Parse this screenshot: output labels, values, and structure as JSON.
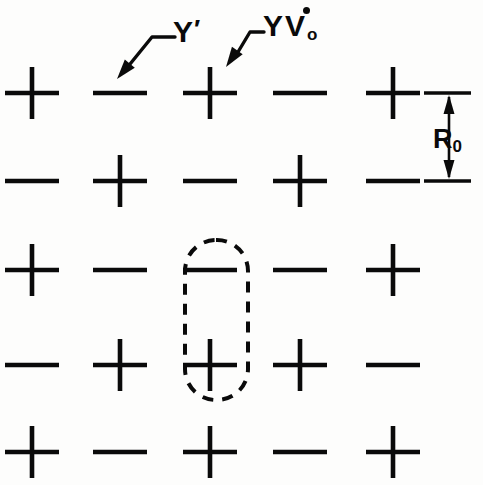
{
  "figure": {
    "background_color": "#fdfdfc",
    "ink_color": "#0a0a0a"
  },
  "lattice": {
    "rows": 5,
    "columns": 5,
    "column_centers_px": [
      32,
      120,
      210,
      300,
      393
    ],
    "row_centers_px": [
      93,
      181,
      270,
      365,
      452
    ],
    "plus_symbol": "+",
    "minus_symbol": "−",
    "signs": [
      [
        "+",
        "-",
        "+",
        "-",
        "+"
      ],
      [
        "-",
        "+",
        "-",
        "+",
        "-"
      ],
      [
        "+",
        "-",
        "-",
        "-",
        "+"
      ],
      [
        "-",
        "+",
        "+",
        "+",
        "-"
      ],
      [
        "+",
        "-",
        "+",
        "-",
        "+"
      ]
    ],
    "glyph_half_width_px": 27,
    "glyph_half_height_px": 26
  },
  "annotations": {
    "y_prime": {
      "text": "Y",
      "prime": "′",
      "target_row": 1,
      "target_column": 2,
      "target_sign": "-",
      "label_x_px": 173,
      "label_y_px": 16,
      "leader_elbow_px": [
        175,
        37
      ],
      "leader_bend_px": [
        152,
        37
      ],
      "leader_tip_px": [
        117,
        79
      ]
    },
    "yv_vacancy": {
      "text": "YV",
      "subscript": "o",
      "overdot": true,
      "target_row": 1,
      "target_column": 3,
      "target_sign": "+",
      "label_x_px": 263,
      "label_y_px": 11,
      "leader_elbow_px": [
        264,
        32
      ],
      "leader_bend_px": [
        250,
        32
      ],
      "leader_tip_px": [
        226,
        67
      ]
    },
    "spacing": {
      "text": "R",
      "subscript": "0",
      "label_x_px": 433,
      "label_y_px": 126,
      "arrow_x_px": 449,
      "arrow_top_y_px": 93,
      "arrow_bottom_y_px": 181,
      "witness_line_x_start_px": 424,
      "witness_line_x_end_px": 471,
      "describes": "nearest-neighbour row separation"
    },
    "cluster": {
      "shape": "dashed-stadium",
      "encloses_rows": [
        3,
        4
      ],
      "encloses_column": 3,
      "encloses_signs": [
        "-",
        "+"
      ],
      "x_px": 185,
      "y_px": 240,
      "width_px": 63,
      "height_px": 160,
      "corner_radius_px": 31,
      "dash_pattern": "11 9",
      "stroke_width_px": 4
    }
  }
}
